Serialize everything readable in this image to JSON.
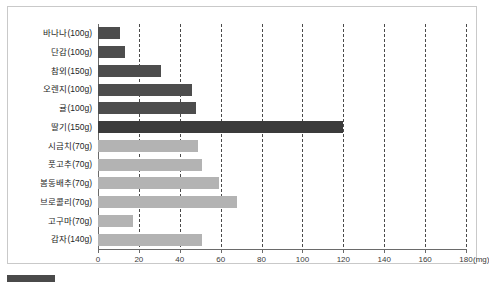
{
  "chart_data": {
    "type": "bar",
    "orientation": "horizontal",
    "title": "",
    "xlabel": "",
    "ylabel": "",
    "unit": "(mg)",
    "xlim": [
      0,
      180
    ],
    "xticks": [
      0,
      20,
      40,
      60,
      80,
      100,
      120,
      140,
      160,
      180
    ],
    "xticklabels": [
      "0",
      "20",
      "40",
      "60",
      "80",
      "100",
      "120",
      "140",
      "160",
      "180"
    ],
    "grid": true,
    "gridstyle": "dashed-vertical",
    "legend": "none",
    "categories": [
      "바나나(100g)",
      "단감(100g)",
      "참외(150g)",
      "오렌지(100g)",
      "귤(100g)",
      "딸기(150g)",
      "시금치(70g)",
      "풋고추(70g)",
      "봄동배추(70g)",
      "브로콜리(70g)",
      "고구마(70g)",
      "감자(140g)"
    ],
    "values": [
      11,
      13,
      31,
      46,
      48,
      120,
      49,
      51,
      59,
      68,
      17,
      51
    ],
    "colors": [
      "#4d4d4d",
      "#4d4d4d",
      "#4d4d4d",
      "#4d4d4d",
      "#4d4d4d",
      "#3b3b3b",
      "#b3b3b3",
      "#b3b3b3",
      "#b3b3b3",
      "#b3b3b3",
      "#b3b3b3",
      "#b3b3b3"
    ],
    "series": [
      {
        "name": "fruit",
        "color": "#4d4d4d"
      },
      {
        "name": "vegetable",
        "color": "#b3b3b3"
      }
    ]
  },
  "caption": {
    "text": "",
    "swatch_color": "#4a4a4a"
  }
}
